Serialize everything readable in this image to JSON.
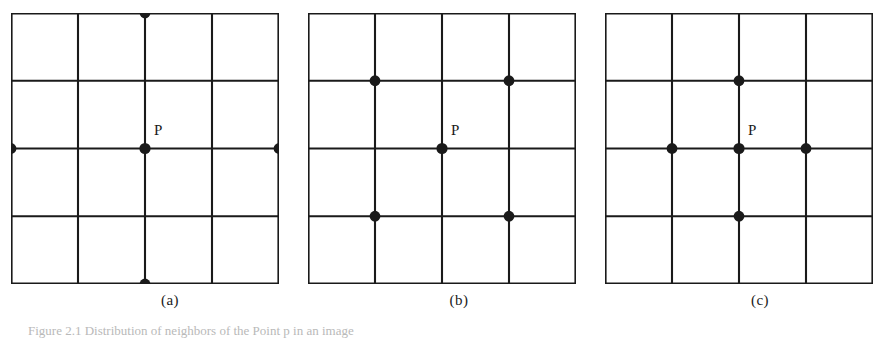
{
  "figure": {
    "background_color": "#ffffff",
    "ink_color": "#1a1a1a",
    "caption_text": "Figure 2.1 Distribution of neighbors of the Point p in an image",
    "point_label": "P"
  },
  "panels": [
    {
      "id": "a",
      "caption": "(a)",
      "point_label": "P",
      "grid": {
        "cols": 4,
        "rows": 4
      },
      "center_node": {
        "col": 2,
        "row": 2
      },
      "neighbor_nodes": [
        {
          "col": 2,
          "row": 0
        },
        {
          "col": 0,
          "row": 2
        },
        {
          "col": 4,
          "row": 2
        },
        {
          "col": 2,
          "row": 4
        }
      ]
    },
    {
      "id": "b",
      "caption": "(b)",
      "point_label": "P",
      "grid": {
        "cols": 4,
        "rows": 4
      },
      "center_node": {
        "col": 2,
        "row": 2
      },
      "neighbor_nodes": [
        {
          "col": 1,
          "row": 1
        },
        {
          "col": 3,
          "row": 1
        },
        {
          "col": 1,
          "row": 3
        },
        {
          "col": 3,
          "row": 3
        }
      ]
    },
    {
      "id": "c",
      "caption": "(c)",
      "point_label": "P",
      "grid": {
        "cols": 4,
        "rows": 4
      },
      "center_node": {
        "col": 2,
        "row": 2
      },
      "neighbor_nodes": [
        {
          "col": 2,
          "row": 1
        },
        {
          "col": 1,
          "row": 2
        },
        {
          "col": 3,
          "row": 2
        },
        {
          "col": 2,
          "row": 3
        }
      ]
    }
  ],
  "chart_data": {
    "type": "diagram",
    "title": "Distribution of neighbors of the Point P in an image",
    "subpanels": [
      "(a)",
      "(b)",
      "(c)"
    ],
    "grid_size": "4x4 cells (5x5 lattice nodes)",
    "marked_point": "P"
  }
}
